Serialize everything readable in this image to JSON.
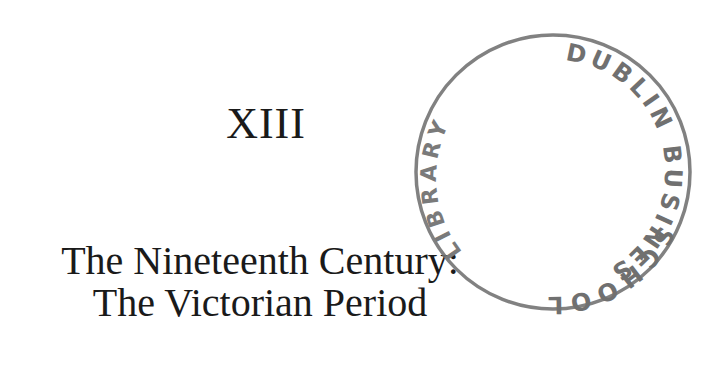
{
  "chapter": {
    "number": "XIII",
    "title_line_1": "The Nineteenth Century:",
    "title_line_2": "The Victorian Period"
  },
  "stamp": {
    "top_text": "DUBLIN BUSINESS",
    "bottom_text": "SCHOOL",
    "left_text": "LIBRARY",
    "color": "#6e6e6e"
  }
}
